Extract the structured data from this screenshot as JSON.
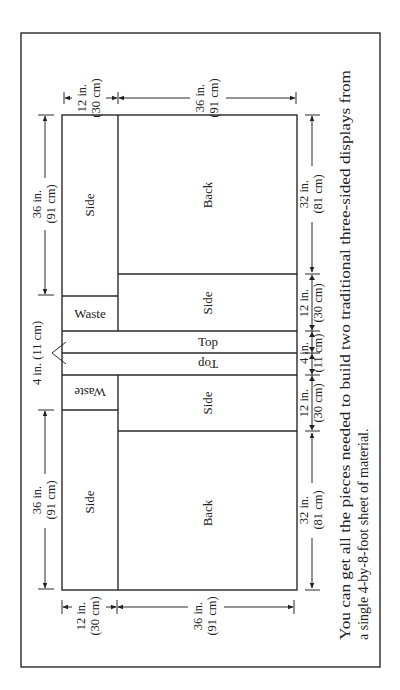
{
  "diagram": {
    "sheet": {
      "width_in": 48,
      "length_in": 96,
      "label": "4-by-8-foot sheet"
    },
    "pieces": {
      "side_top": "Side",
      "back_top": "Back",
      "waste_top": "Waste",
      "side_mid_top": "Side",
      "top_1": "Top",
      "top_2": "Top",
      "waste_bottom": "Waste",
      "side_mid_bottom": "Side",
      "side_bottom": "Side",
      "back_bottom": "Back"
    },
    "dimensions": {
      "top_left_12": [
        "12 in.",
        "(30 cm)"
      ],
      "top_right_36": [
        "36 in.",
        "(91 cm)"
      ],
      "left_upper_36": [
        "36 in.",
        "(91 cm)"
      ],
      "left_lower_36": [
        "36 in.",
        "(91 cm)"
      ],
      "left_4": "4 in. (11 cm)",
      "right_upper_32": [
        "32 in.",
        "(81 cm)"
      ],
      "right_upper_12": [
        "12 in.",
        "(30 cm)"
      ],
      "right_4": [
        "4 in.",
        "(11 cm)"
      ],
      "right_lower_12": [
        "12 in.",
        "(30 cm)"
      ],
      "right_lower_32": [
        "32 in.",
        "(81 cm)"
      ],
      "bottom_left_12": [
        "12 in.",
        "(30 cm)"
      ],
      "bottom_right_36": [
        "36 in.",
        "(91 cm)"
      ]
    },
    "caption": [
      "You can get all the pieces needed to build two traditional three-sided displays from",
      "a single 4-by-8-foot sheet of material."
    ]
  }
}
